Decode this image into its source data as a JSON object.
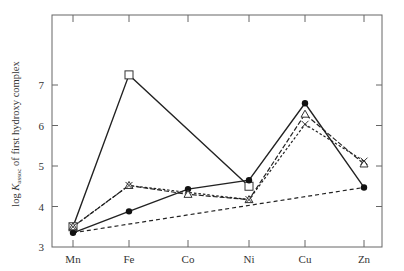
{
  "chart_data": {
    "type": "line",
    "title": "",
    "xlabel": "",
    "ylabel": "log K_assoc of first hydroxy complex",
    "ylabel_parts": {
      "pre": "log ",
      "k": "K",
      "sub": "assoc",
      "post": " of first hydroxy complex"
    },
    "categories": [
      "Mn",
      "Fe",
      "Co",
      "Ni",
      "Cu",
      "Zn"
    ],
    "ylim": [
      3,
      8
    ],
    "yticks": [
      3,
      4,
      5,
      6,
      7
    ],
    "grid": false,
    "legend": "none",
    "series": [
      {
        "name": "series-open-square",
        "style": "solid",
        "marker": "square-open",
        "values": [
          3.5,
          7.25,
          null,
          4.5,
          null,
          null
        ]
      },
      {
        "name": "series-filled-circle",
        "style": "solid",
        "marker": "circle-filled",
        "values": [
          3.35,
          3.88,
          4.43,
          4.65,
          6.55,
          4.47
        ]
      },
      {
        "name": "series-open-triangle",
        "style": "dashed-long",
        "marker": "triangle-open",
        "values": [
          3.5,
          4.52,
          4.3,
          4.17,
          6.28,
          5.05
        ]
      },
      {
        "name": "series-cross",
        "style": "dashed-short",
        "marker": "cross",
        "values": [
          3.5,
          4.52,
          null,
          4.17,
          6.03,
          5.12
        ]
      },
      {
        "name": "series-baseline",
        "style": "dashed",
        "marker": "none",
        "values": [
          3.35,
          null,
          null,
          null,
          null,
          4.47
        ]
      }
    ]
  }
}
